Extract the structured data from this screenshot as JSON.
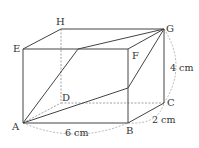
{
  "diagram": {
    "type": "cuboid",
    "vertices": {
      "A": {
        "label": "A",
        "x": 23,
        "y": 123
      },
      "B": {
        "label": "B",
        "x": 128,
        "y": 123
      },
      "C": {
        "label": "C",
        "x": 164,
        "y": 103
      },
      "D": {
        "label": "D",
        "x": 61,
        "y": 103
      },
      "E": {
        "label": "E",
        "x": 23,
        "y": 49
      },
      "F": {
        "label": "F",
        "x": 128,
        "y": 49
      },
      "G": {
        "label": "G",
        "x": 164,
        "y": 29
      },
      "H": {
        "label": "H",
        "x": 61,
        "y": 29
      }
    },
    "dimensions": {
      "AB": "6 cm",
      "BC": "2 cm",
      "CG": "4 cm"
    },
    "colors": {
      "line": "#444444",
      "dashed": "#888888"
    }
  }
}
